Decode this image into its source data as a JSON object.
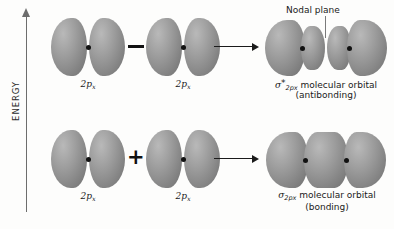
{
  "figure": {
    "axis": {
      "label": "ENERGY",
      "direction": "up"
    },
    "rows": [
      {
        "id": "antibonding-row",
        "operator": "−",
        "operator_name": "minus-sign",
        "arrow": "→",
        "inputs": [
          {
            "base": "2p",
            "sub": "x"
          },
          {
            "base": "2p",
            "sub": "x"
          }
        ],
        "result": {
          "sigma": "σ",
          "star": "*",
          "sub": "2p",
          "sub2": "x",
          "text": "molecular orbital",
          "paren": "(antibonding)"
        },
        "annotation": {
          "text": "Nodal plane"
        }
      },
      {
        "id": "bonding-row",
        "operator": "+",
        "operator_name": "plus-sign",
        "arrow": "→",
        "inputs": [
          {
            "base": "2p",
            "sub": "x"
          },
          {
            "base": "2p",
            "sub": "x"
          }
        ],
        "result": {
          "sigma": "σ",
          "star": "",
          "sub": "2p",
          "sub2": "x",
          "text": "molecular orbital",
          "paren": "(bonding)"
        }
      }
    ]
  },
  "colors": {
    "background": "#fdfdfc",
    "lobe_dark": "#6e6e6e",
    "lobe_light": "#b9b9b9",
    "nucleus": "#111111",
    "axis": "#6d6d6d",
    "text": "#1a1a1a"
  }
}
